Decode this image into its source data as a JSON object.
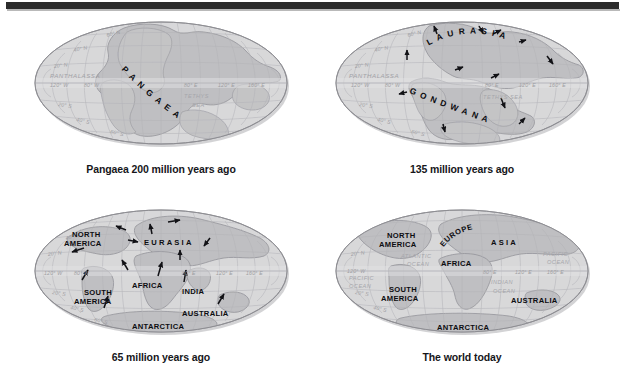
{
  "figure": {
    "type": "continental-drift-plate-tectonics-map-series",
    "panel_count": 4,
    "projection": "mollweide-oval",
    "colors": {
      "page_background": "#ffffff",
      "top_rule": "#2b2b2b",
      "ocean_fill": "#d8d8da",
      "land_fill": "#bfbfc2",
      "graticule": "#b2b2b6",
      "outline": "#8e8e93",
      "label_dark": "#0d0d11",
      "label_light": "#a0a0a5",
      "arrow": "#121216"
    }
  },
  "panels": [
    {
      "id": "panel-pangaea",
      "caption": "Pangaea 200 million years ago",
      "landmasses": [
        {
          "name": "PANGAEA",
          "style": "arc"
        }
      ],
      "oceans": [
        {
          "name": "PANTHALASSA"
        },
        {
          "name": "TETHYS",
          "name2": "SEA"
        }
      ],
      "graticule_labels": {
        "lat_n": [
          "60° N",
          "40° N",
          "20° N"
        ],
        "lat_s": [
          "20° S",
          "40° S",
          "60° S"
        ],
        "lon_w": [
          "120° W",
          "80° W"
        ],
        "lon_e": [
          "80° E",
          "120° E",
          "160° E"
        ]
      },
      "arrows": []
    },
    {
      "id": "panel-135ma",
      "caption": "135 million years ago",
      "landmasses": [
        {
          "name": "LAURASIA",
          "style": "arc"
        },
        {
          "name": "GONDWANA",
          "style": "arc"
        }
      ],
      "oceans": [
        {
          "name": "PANTHALASSA"
        },
        {
          "name": "TETHYS SEA"
        }
      ],
      "graticule_labels": {
        "lat_n": [
          "60° N",
          "40° N",
          "20° N"
        ],
        "lat_s": [
          "20° S",
          "40° S",
          "60° S"
        ],
        "lon_w": [
          "120° W",
          "80° W"
        ],
        "lon_e": [
          "80° E",
          "120° E",
          "160° E"
        ]
      },
      "arrow_count": 12
    },
    {
      "id": "panel-65ma",
      "caption": "65 million years ago",
      "landmasses": [
        {
          "name": "NORTH",
          "name2": "AMERICA"
        },
        {
          "name": "EURASIA",
          "style": "spaced"
        },
        {
          "name": "AFRICA"
        },
        {
          "name": "SOUTH",
          "name2": "AMERICA"
        },
        {
          "name": "INDIA"
        },
        {
          "name": "AUSTRALIA"
        },
        {
          "name": "ANTARCTICA"
        }
      ],
      "oceans": [],
      "graticule_labels": {
        "lat_n": [
          "40° N",
          "20° N"
        ],
        "lat_s": [
          "20° S",
          "40° S",
          "60° S"
        ],
        "lon_w": [
          "120° W",
          "80° W"
        ],
        "lon_e": [
          "80° E",
          "120° E",
          "160° E"
        ]
      },
      "arrow_count": 12
    },
    {
      "id": "panel-today",
      "caption": "The world today",
      "landmasses": [
        {
          "name": "NORTH",
          "name2": "AMERICA"
        },
        {
          "name": "EUROPE",
          "style": "arc"
        },
        {
          "name": "ASIA",
          "style": "spaced"
        },
        {
          "name": "AFRICA"
        },
        {
          "name": "SOUTH",
          "name2": "AMERICA"
        },
        {
          "name": "AUSTRALIA"
        },
        {
          "name": "ANTARCTICA"
        }
      ],
      "oceans": [
        {
          "name": "ATLANTIC",
          "name2": "OCEAN"
        },
        {
          "name": "PACIFIC",
          "name2": "OCEAN"
        },
        {
          "name": "PACIFIC",
          "name2": "OCEAN",
          "side": "right"
        },
        {
          "name": "INDIAN",
          "name2": "OCEAN"
        }
      ],
      "graticule_labels": {
        "lat_n": [
          "20° N"
        ],
        "lat_s": [
          "20° S",
          "40° S"
        ],
        "lon_w": [
          "120° W"
        ],
        "lon_e": [
          "80° E",
          "120° E",
          "160° E"
        ]
      },
      "arrow_count": 0
    }
  ]
}
